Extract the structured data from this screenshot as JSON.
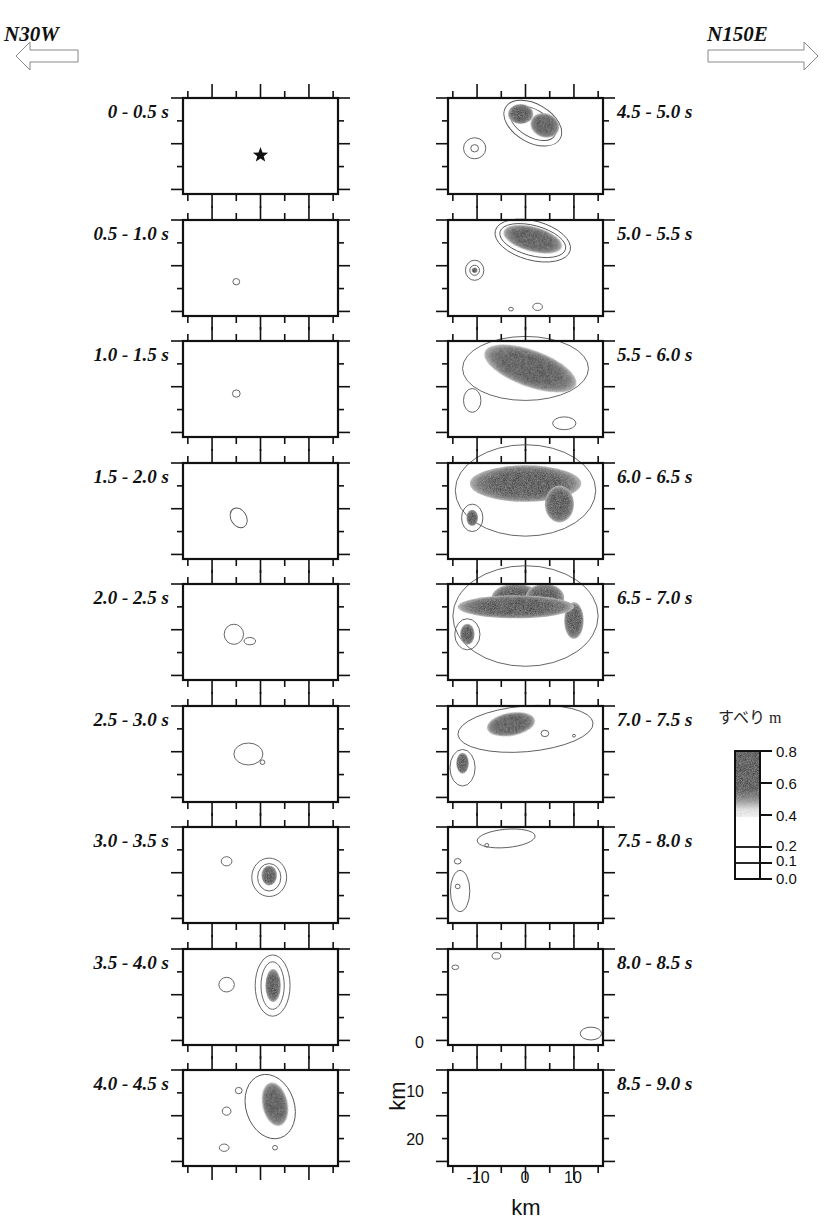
{
  "chart_data": {
    "type": "heatmap",
    "title": "",
    "direction_left": "N30W",
    "direction_right": "N150E",
    "xlabel": "km",
    "ylabel": "km",
    "x_ticks": [
      "-10",
      "0",
      "10"
    ],
    "y_ticks": [
      "0",
      "10",
      "20"
    ],
    "xlim": [
      -16,
      16
    ],
    "ylim": [
      0,
      21
    ],
    "colorbar": {
      "title": "すべり m",
      "ticks": [
        "0.8",
        "0.6",
        "0.4",
        "0.2",
        "0.1",
        "0.0"
      ],
      "range": [
        0.0,
        0.8
      ]
    },
    "panels": [
      {
        "label": "0 - 0.5 s",
        "note": "hypocenter star at about (0, 10)"
      },
      {
        "label": "0.5 - 1.0 s"
      },
      {
        "label": "1.0 - 1.5 s"
      },
      {
        "label": "1.5 - 2.0 s"
      },
      {
        "label": "2.0 - 2.5 s"
      },
      {
        "label": "2.5 - 3.0 s"
      },
      {
        "label": "3.0 - 3.5 s"
      },
      {
        "label": "3.5 - 4.0 s"
      },
      {
        "label": "4.0 - 4.5 s"
      },
      {
        "label": "4.5 - 5.0 s"
      },
      {
        "label": "5.0 - 5.5 s"
      },
      {
        "label": "5.5 - 6.0 s"
      },
      {
        "label": "6.0 - 6.5 s"
      },
      {
        "label": "6.5 - 7.0 s"
      },
      {
        "label": "7.0 - 7.5 s"
      },
      {
        "label": "7.5 - 8.0 s"
      },
      {
        "label": "8.0 - 8.5 s"
      },
      {
        "label": "8.5 - 9.0 s"
      }
    ],
    "grid": false,
    "legend_position": "right"
  }
}
